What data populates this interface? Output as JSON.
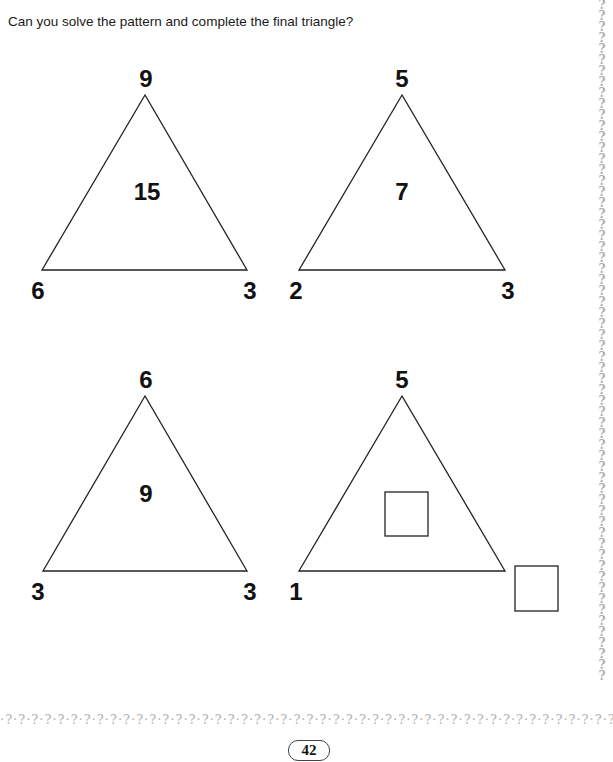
{
  "instruction": "Can you solve the pattern and complete the final triangle?",
  "triangles": [
    {
      "top": "9",
      "left": "6",
      "right": "3",
      "center": "15"
    },
    {
      "top": "5",
      "left": "2",
      "right": "3",
      "center": "7"
    },
    {
      "top": "6",
      "left": "3",
      "right": "3",
      "center": "9"
    },
    {
      "top": "5",
      "left": "1",
      "right": "",
      "center": ""
    }
  ],
  "answer_boxes": {
    "center_placeholder": "",
    "right_corner_placeholder": ""
  },
  "decoration": {
    "right_border": "? ? ? ? ? ? ? ? ? ? ? ? ? ? ? ? ? ? ? ? ? ? ? ? ? ? ? ? ? ? ? ? ? ? ? ? ? ? ? ? ? ? ? ? ? ? ? ? ? ? ? ? ? ? ? ? ? ? ? ? ? ?",
    "bottom_border": "·?·?·?·?·?·?·?·?·?·?·?·?·?·?·?·?·?·?·?·?·?·?·?·?·?·?·?·?·?·?·?·?·?·?·?·?·?·?·?·?·?·?·?·?·?·?·?·?"
  },
  "page_number": "42"
}
